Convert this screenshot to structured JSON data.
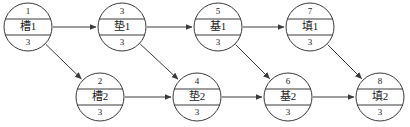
{
  "diagram": {
    "type": "activity-on-node network diagram",
    "colors": {
      "stroke": "#3a3a3a",
      "background": "#ffffff",
      "text": "#1a1a1a"
    },
    "geometry": {
      "radius": 24,
      "top_divider_offset": -8,
      "bottom_divider_offset": 8
    },
    "nodes": [
      {
        "key": "n1",
        "id": "1",
        "label": "槽1",
        "duration": "3",
        "cx": 28,
        "cy": 27,
        "row": "top"
      },
      {
        "key": "n3",
        "id": "3",
        "label": "垫1",
        "duration": "3",
        "cx": 122,
        "cy": 27,
        "row": "top"
      },
      {
        "key": "n5",
        "id": "5",
        "label": "基1",
        "duration": "3",
        "cx": 218,
        "cy": 27,
        "row": "top"
      },
      {
        "key": "n7",
        "id": "7",
        "label": "填1",
        "duration": "3",
        "cx": 310,
        "cy": 27,
        "row": "top"
      },
      {
        "key": "n2",
        "id": "2",
        "label": "槽2",
        "duration": "3",
        "cx": 100,
        "cy": 97,
        "row": "bottom"
      },
      {
        "key": "n4",
        "id": "4",
        "label": "垫2",
        "duration": "3",
        "cx": 197,
        "cy": 97,
        "row": "bottom"
      },
      {
        "key": "n6",
        "id": "6",
        "label": "基2",
        "duration": "3",
        "cx": 288,
        "cy": 97,
        "row": "bottom"
      },
      {
        "key": "n8",
        "id": "8",
        "label": "填2",
        "duration": "3",
        "cx": 380,
        "cy": 97,
        "row": "bottom"
      }
    ],
    "edges": [
      {
        "from": "n1",
        "to": "n3"
      },
      {
        "from": "n1",
        "to": "n2"
      },
      {
        "from": "n3",
        "to": "n5"
      },
      {
        "from": "n3",
        "to": "n4"
      },
      {
        "from": "n5",
        "to": "n7"
      },
      {
        "from": "n5",
        "to": "n6"
      },
      {
        "from": "n7",
        "to": "n8"
      },
      {
        "from": "n2",
        "to": "n4"
      },
      {
        "from": "n4",
        "to": "n6"
      },
      {
        "from": "n6",
        "to": "n8"
      }
    ]
  }
}
